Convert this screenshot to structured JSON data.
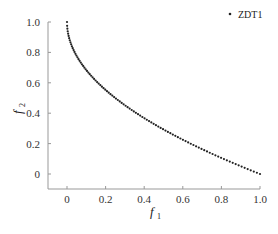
{
  "chart_data": {
    "type": "scatter",
    "title": "",
    "xlabel": "f1",
    "ylabel": "f2",
    "xlim": [
      -0.1,
      1.0
    ],
    "ylim": [
      -0.1,
      1.0
    ],
    "xticks": [
      "0",
      "0.2",
      "0.4",
      "0.6",
      "0.8",
      "1.0"
    ],
    "yticks": [
      "0",
      "0.2",
      "0.4",
      "0.6",
      "0.8",
      "1.0"
    ],
    "grid": false,
    "legend_position": "top-right",
    "series": [
      {
        "name": "ZDT1",
        "marker": "dot",
        "color": "#222222",
        "function": "f2 = 1 - sqrt(f1)",
        "n_points": 100,
        "x_range": [
          0,
          1
        ],
        "sample_points": [
          [
            0,
            1.0
          ],
          [
            0.01,
            0.9
          ],
          [
            0.05,
            0.776
          ],
          [
            0.1,
            0.684
          ],
          [
            0.2,
            0.553
          ],
          [
            0.3,
            0.452
          ],
          [
            0.4,
            0.368
          ],
          [
            0.5,
            0.293
          ],
          [
            0.6,
            0.225
          ],
          [
            0.7,
            0.163
          ],
          [
            0.8,
            0.106
          ],
          [
            0.9,
            0.051
          ],
          [
            1.0,
            0.0
          ]
        ]
      }
    ]
  },
  "labels": {
    "x_axis": "f",
    "x_sub": "1",
    "y_axis": "f",
    "y_sub": "2",
    "legend": "ZDT1"
  }
}
